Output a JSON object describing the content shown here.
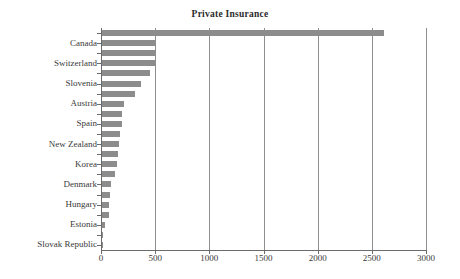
{
  "chart": {
    "title": "Private Insurance",
    "xlabel": "",
    "ylabel": ""
  },
  "chart_data": {
    "type": "bar",
    "orientation": "horizontal",
    "title": "Private Insurance",
    "xlabel": "",
    "ylabel": "",
    "xlim": [
      0,
      3000
    ],
    "xticks": [
      0,
      500,
      1000,
      1500,
      2000,
      2500,
      3000
    ],
    "xtick_labels": [
      "0",
      "500",
      "1000",
      "1500",
      "2000",
      "2500",
      "3000"
    ],
    "grid": "vertical",
    "legend": "none",
    "bar_color": "#8c8c8c",
    "label_interval": 2,
    "note": "Category axis has 22 tick positions; only every other category is labelled on the axis.",
    "categories": [
      "",
      "Canada",
      "",
      "Switzerland",
      "",
      "Slovenia",
      "",
      "Austria",
      "",
      "Spain",
      "",
      "New Zealand",
      "",
      "Korea",
      "",
      "Denmark",
      "",
      "Hungary",
      "",
      "Estonia",
      "",
      "Slovak Republic"
    ],
    "visible_tick_labels": [
      "Canada",
      "Switzerland",
      "Slovenia",
      "Austria",
      "Spain",
      "New Zealand",
      "Korea",
      "Denmark",
      "Hungary",
      "Estonia",
      "Slovak Republic"
    ],
    "values": [
      2600,
      500,
      495,
      490,
      440,
      360,
      300,
      205,
      185,
      180,
      170,
      155,
      145,
      135,
      120,
      80,
      70,
      65,
      62,
      25,
      4,
      2
    ]
  }
}
